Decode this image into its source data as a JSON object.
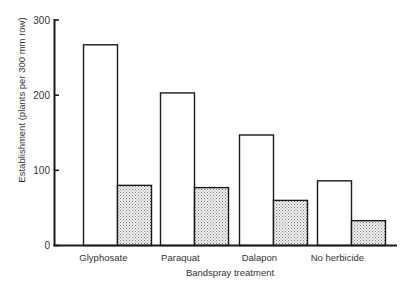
{
  "chart_data": {
    "type": "bar",
    "title": "",
    "xlabel": "Bandspray treatment",
    "ylabel": "Establishment (plants per 300 mm row)",
    "categories": [
      "Glyphosate",
      "Paraquat",
      "Dalapon",
      "No herbicide"
    ],
    "series": [
      {
        "name": "Open bars",
        "fill": "#ffffff",
        "values": [
          267,
          203,
          147,
          86
        ]
      },
      {
        "name": "Stippled bars",
        "fill": "stippled",
        "values": [
          80,
          77,
          60,
          33
        ]
      }
    ],
    "ylim": [
      0,
      300
    ],
    "yticks": [
      0,
      100,
      200,
      300
    ],
    "grid": false,
    "legend": "none"
  },
  "axis": {
    "ytick_labels": [
      "0",
      "100",
      "200",
      "300"
    ]
  }
}
